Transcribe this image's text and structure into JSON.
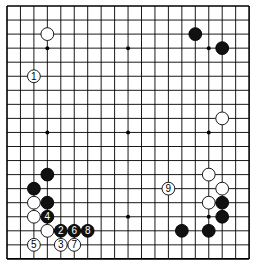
{
  "board": {
    "size": 19,
    "origin_x": 7,
    "origin_y": 6,
    "step_x": 13.45,
    "step_y": 14.05,
    "star_points": [
      [
        3,
        3
      ],
      [
        9,
        3
      ],
      [
        15,
        3
      ],
      [
        3,
        9
      ],
      [
        9,
        9
      ],
      [
        15,
        9
      ],
      [
        3,
        15
      ],
      [
        9,
        15
      ],
      [
        15,
        15
      ]
    ],
    "stones": [
      {
        "color": "white",
        "col": 3,
        "row": 2,
        "label": ""
      },
      {
        "color": "white",
        "col": 2,
        "row": 5,
        "label": "1"
      },
      {
        "color": "black",
        "col": 14,
        "row": 2,
        "label": ""
      },
      {
        "color": "black",
        "col": 16,
        "row": 3,
        "label": ""
      },
      {
        "color": "white",
        "col": 16,
        "row": 8,
        "label": ""
      },
      {
        "color": "black",
        "col": 3,
        "row": 12,
        "label": ""
      },
      {
        "color": "black",
        "col": 2,
        "row": 13,
        "label": ""
      },
      {
        "color": "white",
        "col": 2,
        "row": 14,
        "label": ""
      },
      {
        "color": "black",
        "col": 3,
        "row": 14,
        "label": ""
      },
      {
        "color": "white",
        "col": 2,
        "row": 15,
        "label": ""
      },
      {
        "color": "black",
        "col": 3,
        "row": 15,
        "label": "4"
      },
      {
        "color": "white",
        "col": 3,
        "row": 16,
        "label": ""
      },
      {
        "color": "black",
        "col": 4,
        "row": 16,
        "label": "2"
      },
      {
        "color": "black",
        "col": 5,
        "row": 16,
        "label": "6"
      },
      {
        "color": "black",
        "col": 6,
        "row": 16,
        "label": "8"
      },
      {
        "color": "white",
        "col": 2,
        "row": 17,
        "label": "5"
      },
      {
        "color": "white",
        "col": 4,
        "row": 17,
        "label": "3"
      },
      {
        "color": "white",
        "col": 5,
        "row": 17,
        "label": "7"
      },
      {
        "color": "white",
        "col": 15,
        "row": 12,
        "label": ""
      },
      {
        "color": "white",
        "col": 12,
        "row": 13,
        "label": "9"
      },
      {
        "color": "white",
        "col": 16,
        "row": 13,
        "label": ""
      },
      {
        "color": "white",
        "col": 15,
        "row": 14,
        "label": ""
      },
      {
        "color": "black",
        "col": 16,
        "row": 14,
        "label": ""
      },
      {
        "color": "black",
        "col": 16,
        "row": 15,
        "label": ""
      },
      {
        "color": "black",
        "col": 13,
        "row": 16,
        "label": ""
      },
      {
        "color": "black",
        "col": 15,
        "row": 16,
        "label": ""
      }
    ]
  }
}
